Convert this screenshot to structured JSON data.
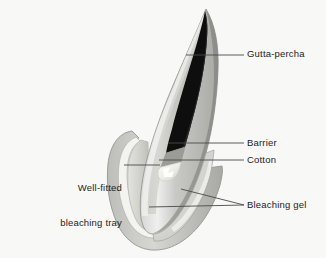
{
  "figure": {
    "type": "dental-cross-section-diagram",
    "background_color": "#f8f8f6"
  },
  "labels": [
    {
      "id": "gutta-percha",
      "text": "Gutta-percha",
      "side": "right",
      "leader": {
        "from": [
          244,
          55
        ],
        "to": [
          186,
          55
        ]
      }
    },
    {
      "id": "barrier",
      "text": "Barrier",
      "side": "right",
      "leader": {
        "from": [
          244,
          143
        ],
        "to": [
          168,
          143
        ]
      }
    },
    {
      "id": "cotton",
      "text": "Cotton",
      "side": "right",
      "leader": {
        "from": [
          244,
          160
        ],
        "to": [
          159,
          160
        ]
      }
    },
    {
      "id": "bleaching-gel",
      "text": "Bleaching gel",
      "side": "right",
      "leader": {
        "from": [
          244,
          205
        ],
        "to": [
          149,
          207
        ]
      },
      "leader2": {
        "from": [
          244,
          205
        ],
        "to": [
          181,
          189
        ]
      }
    },
    {
      "id": "well-fitted-bleaching-tray",
      "text": "Well-fitted\nbleaching tray",
      "line1": "Well-fitted",
      "line2": "bleaching tray",
      "side": "left",
      "leader": {
        "from": [
          125,
          165
        ],
        "to": [
          160,
          165
        ]
      }
    }
  ],
  "structures": [
    {
      "id": "tooth-enamel",
      "name": "tooth crown / enamel",
      "color": "#b4b4b4"
    },
    {
      "id": "tooth-shadow",
      "name": "tooth shaded face",
      "color": "#8c8c8c"
    },
    {
      "id": "tooth-highlight",
      "name": "tooth highlight",
      "color": "#e6e6e4"
    },
    {
      "id": "gutta-percha",
      "name": "gutta-percha root filling",
      "color": "#111111"
    },
    {
      "id": "barrier",
      "name": "barrier material",
      "color": "#9a9a9a"
    },
    {
      "id": "cotton",
      "name": "cotton pellet",
      "color": "#f2f2ee"
    },
    {
      "id": "bleaching-gel",
      "name": "bleaching gel",
      "color": "#d9d9d5"
    },
    {
      "id": "tray",
      "name": "well-fitted bleaching tray",
      "color": "#c8c8c6"
    },
    {
      "id": "tray-outline",
      "name": "tray outer wall",
      "color": "#a0a09e"
    },
    {
      "id": "leader-line",
      "name": "leader line",
      "color": "#4a4a4a"
    }
  ]
}
